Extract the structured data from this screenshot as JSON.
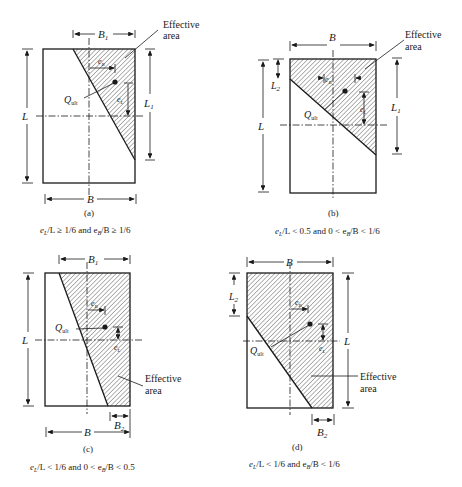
{
  "figure": {
    "panels": [
      {
        "id": "a",
        "tag": "(a)",
        "caption_parts": [
          "e",
          "L",
          "/L ≥ 1/6 and e",
          "B",
          "/B ≥ 1/6"
        ],
        "labels": {
          "top": "B",
          "top_sub": "1",
          "bottom": "B",
          "left": "L",
          "right": "L",
          "right_sub": "1",
          "eB": "e",
          "eB_sub": "B",
          "eL": "e",
          "eL_sub": "L",
          "load": "Q",
          "load_sub": "ult",
          "effective1": "Effective",
          "effective2": "area"
        }
      },
      {
        "id": "b",
        "tag": "(b)",
        "caption_parts": [
          "e",
          "L",
          "/L < 0.5 and 0 < e",
          "B",
          "/B < 1/6"
        ],
        "labels": {
          "top": "B",
          "left": "L",
          "left2": "L",
          "left2_sub": "2",
          "right": "L",
          "right_sub": "1",
          "eB": "e",
          "eB_sub": "B",
          "eL": "e",
          "eL_sub": "L",
          "load": "Q",
          "load_sub": "ult",
          "effective1": "Effective",
          "effective2": "area"
        }
      },
      {
        "id": "c",
        "tag": "(c)",
        "caption_parts": [
          "e",
          "L",
          "/L < 1/6 and 0 < e",
          "B",
          "/B < 0.5"
        ],
        "labels": {
          "top": "B",
          "top_sub": "1",
          "bottom": "B",
          "bottom2": "B",
          "bottom2_sub": "2",
          "left": "L",
          "eB": "e",
          "eB_sub": "B",
          "eL": "e",
          "eL_sub": "L",
          "load": "Q",
          "load_sub": "ult",
          "effective1": "Effective",
          "effective2": "area"
        }
      },
      {
        "id": "d",
        "tag": "(d)",
        "caption_parts": [
          "e",
          "L",
          "/L < 1/6 and e",
          "B",
          "/B < 1/6"
        ],
        "labels": {
          "top": "B",
          "left2": "L",
          "left2_sub": "2",
          "right": "L",
          "bottom2": "B",
          "bottom2_sub": "2",
          "eB": "e",
          "eB_sub": "B",
          "eL": "e",
          "eL_sub": "L",
          "load": "Q",
          "load_sub": "ult",
          "effective1": "Effective",
          "effective2": "area"
        }
      }
    ],
    "colors": {
      "line": "#1a1a1a",
      "hatch": "#555555",
      "background": "#ffffff"
    }
  }
}
